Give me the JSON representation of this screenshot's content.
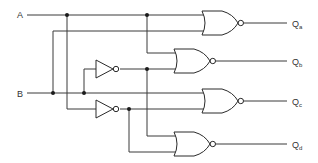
{
  "diagram": {
    "title": "",
    "inputs": [
      {
        "id": "A",
        "label": "A"
      },
      {
        "id": "B",
        "label": "B"
      }
    ],
    "outputs": [
      {
        "id": "Qa",
        "label": "Q",
        "sub": "a"
      },
      {
        "id": "Qb",
        "label": "Q",
        "sub": "b"
      },
      {
        "id": "Qc",
        "label": "Q",
        "sub": "c"
      },
      {
        "id": "Qd",
        "label": "Q",
        "sub": "d"
      }
    ],
    "components": [
      {
        "type": "NOR",
        "name": "gate-qa",
        "inputs": [
          "A",
          "B"
        ],
        "output": "Qa"
      },
      {
        "type": "NOR",
        "name": "gate-qb",
        "inputs": [
          "A",
          "NOT B"
        ],
        "output": "Qb"
      },
      {
        "type": "NOR",
        "name": "gate-qc",
        "inputs": [
          "NOT A",
          "B"
        ],
        "output": "Qc"
      },
      {
        "type": "NOR",
        "name": "gate-qd",
        "inputs": [
          "NOT A",
          "NOT B"
        ],
        "output": "Qd"
      },
      {
        "type": "NOT",
        "name": "inverter-b",
        "input": "B"
      },
      {
        "type": "NOT",
        "name": "inverter-a",
        "input": "A"
      }
    ],
    "colors": {
      "line": "#3a3a3a",
      "background": "#ffffff"
    }
  }
}
